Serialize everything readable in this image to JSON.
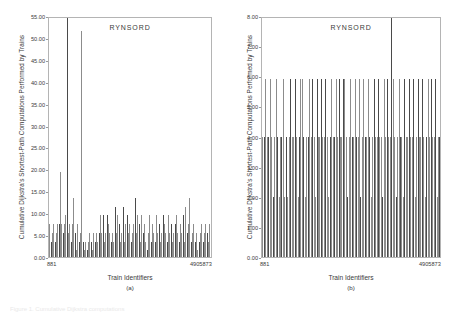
{
  "figure": {
    "background_color": "#ffffff",
    "bottom_caption": "Figure 1.  Cumulative Dijkstra computations"
  },
  "chart_data": [
    {
      "type": "bar",
      "panel_id": "a",
      "title": "RYNSORD",
      "xlabel": "Train Identifiers",
      "ylabel": "Cumulative Dijkstra's Shortest-Path Computations Performed by Trains",
      "subcaption": "(a)",
      "ylim": [
        0,
        55
      ],
      "yticks": [
        0,
        5,
        10,
        15,
        20,
        25,
        30,
        35,
        40,
        45,
        50,
        55
      ],
      "ytick_labels": [
        "0.00",
        "5.00",
        "10.00",
        "15.00",
        "20.00",
        "25.00",
        "30.00",
        "35.00",
        "40.00",
        "45.00",
        "50.00",
        "55.00"
      ],
      "xtick_labels": [
        "881",
        "4905873"
      ],
      "grid": false,
      "legend": "none",
      "bar_color": "#8c8c8c",
      "bar_color_dark": "#4a4a4a",
      "categories": [
        "881",
        "2",
        "3",
        "4",
        "5",
        "6",
        "7",
        "8",
        "9",
        "10",
        "11",
        "12",
        "13",
        "14",
        "15",
        "16",
        "17",
        "18",
        "19",
        "20",
        "21",
        "22",
        "23",
        "24",
        "25",
        "26",
        "27",
        "28",
        "29",
        "30",
        "31",
        "32",
        "33",
        "34",
        "35",
        "36",
        "37",
        "38",
        "39",
        "40",
        "41",
        "42",
        "43",
        "44",
        "45",
        "46",
        "47",
        "48",
        "49",
        "50",
        "51",
        "52",
        "53",
        "54",
        "55",
        "56",
        "57",
        "58",
        "59",
        "60",
        "61",
        "62",
        "63",
        "64",
        "65",
        "66",
        "67",
        "68",
        "69",
        "70",
        "71",
        "72",
        "73",
        "74",
        "75",
        "76",
        "77",
        "78",
        "79",
        "80",
        "81",
        "82",
        "83",
        "84",
        "85",
        "86",
        "87",
        "88",
        "89",
        "90",
        "91",
        "92",
        "93",
        "94",
        "95",
        "96",
        "97",
        "98",
        "99",
        "100",
        "101",
        "102",
        "103",
        "104",
        "105",
        "106",
        "107",
        "108",
        "109",
        "110",
        "111",
        "112",
        "113",
        "114",
        "115",
        "116",
        "117",
        "118",
        "119",
        "120",
        "121",
        "122",
        "4905873"
      ],
      "values": [
        7.5,
        3.4,
        5.4,
        7.5,
        3.4,
        5.4,
        7.5,
        7.5,
        19.3,
        7.5,
        5.4,
        7.5,
        9.5,
        55.0,
        5.4,
        7.5,
        3.4,
        7.5,
        13.4,
        5.4,
        1.6,
        7.5,
        3.4,
        5.4,
        51.5,
        3.4,
        1.6,
        3.4,
        1.6,
        3.4,
        5.4,
        3.4,
        1.6,
        5.4,
        3.4,
        5.4,
        3.4,
        5.4,
        9.5,
        5.4,
        9.5,
        3.4,
        5.4,
        9.5,
        7.5,
        5.4,
        3.4,
        5.4,
        3.4,
        11.4,
        5.4,
        9.5,
        7.5,
        3.4,
        5.4,
        11.4,
        3.4,
        7.5,
        9.5,
        5.4,
        7.5,
        3.4,
        5.4,
        7.5,
        13.4,
        5.4,
        9.5,
        7.5,
        3.4,
        9.5,
        5.4,
        7.5,
        3.4,
        1.6,
        5.4,
        9.5,
        3.4,
        7.5,
        5.4,
        3.4,
        9.5,
        5.4,
        7.5,
        3.4,
        5.4,
        9.5,
        7.5,
        5.4,
        3.4,
        9.5,
        5.4,
        7.5,
        3.4,
        5.4,
        7.5,
        9.5,
        5.4,
        3.4,
        7.5,
        5.4,
        9.5,
        3.4,
        11.4,
        5.4,
        7.5,
        13.4,
        3.4,
        5.4,
        7.5,
        3.4,
        5.4,
        1.6,
        3.4,
        5.4,
        7.5,
        3.4,
        5.4,
        7.5,
        5.4,
        3.4,
        7.5,
        5.4,
        9.5
      ]
    },
    {
      "type": "bar",
      "panel_id": "b",
      "title": "RYNSORD",
      "xlabel": "Train Identifiers",
      "ylabel": "Cumulative Dijkstra's Shortest-Path Computations Performed by Trains",
      "subcaption": "(b)",
      "ylim": [
        0,
        8
      ],
      "yticks": [
        0,
        1,
        2,
        3,
        4,
        5,
        6,
        7,
        8
      ],
      "ytick_labels": [
        "0.00",
        "1.00",
        "2.00",
        "3.00",
        "4.00",
        "5.00",
        "6.00",
        "7.00",
        "8.00"
      ],
      "xtick_labels": [
        "881",
        "4905873"
      ],
      "grid": false,
      "legend": "none",
      "bar_color": "#8c8c8c",
      "bar_color_dark": "#4a4a4a",
      "categories": [
        "881",
        "2",
        "3",
        "4",
        "5",
        "6",
        "7",
        "8",
        "9",
        "10",
        "11",
        "12",
        "13",
        "14",
        "15",
        "16",
        "17",
        "18",
        "19",
        "20",
        "21",
        "22",
        "23",
        "24",
        "25",
        "26",
        "27",
        "28",
        "29",
        "30",
        "31",
        "32",
        "33",
        "34",
        "35",
        "36",
        "37",
        "38",
        "39",
        "40",
        "41",
        "42",
        "43",
        "44",
        "45",
        "46",
        "47",
        "48",
        "49",
        "50",
        "51",
        "52",
        "53",
        "54",
        "55",
        "56",
        "57",
        "58",
        "59",
        "60",
        "61",
        "62",
        "63",
        "64",
        "65",
        "66",
        "67",
        "68",
        "69",
        "70",
        "71",
        "72",
        "73",
        "74",
        "75",
        "76",
        "77",
        "78",
        "79",
        "80",
        "81",
        "82",
        "83",
        "84",
        "85",
        "86",
        "87",
        "88",
        "89",
        "90",
        "91",
        "92",
        "93",
        "94",
        "95",
        "96",
        "97",
        "98",
        "99",
        "100",
        "101",
        "102",
        "103",
        "104",
        "105",
        "106",
        "107",
        "108",
        "109",
        "110",
        "111",
        "112",
        "113",
        "114",
        "115",
        "116",
        "117",
        "118",
        "119",
        "120",
        "121",
        "122",
        "4905873"
      ],
      "values": [
        4.0,
        4.0,
        5.9,
        4.0,
        4.0,
        5.9,
        4.0,
        2.0,
        4.0,
        5.9,
        4.0,
        2.0,
        4.0,
        4.0,
        5.9,
        2.0,
        4.0,
        2.0,
        4.0,
        5.9,
        4.0,
        4.0,
        5.9,
        4.0,
        2.0,
        4.0,
        5.9,
        5.9,
        4.0,
        2.0,
        4.0,
        4.0,
        5.9,
        4.0,
        5.9,
        4.0,
        2.0,
        5.9,
        4.0,
        4.0,
        5.9,
        4.0,
        4.0,
        5.9,
        4.0,
        2.0,
        4.0,
        5.9,
        4.0,
        4.0,
        5.9,
        4.0,
        5.9,
        4.0,
        4.0,
        5.9,
        5.9,
        4.0,
        2.0,
        4.0,
        5.9,
        4.0,
        4.0,
        5.9,
        4.0,
        4.0,
        5.9,
        2.0,
        4.0,
        5.9,
        4.0,
        4.0,
        5.9,
        4.0,
        2.0,
        4.0,
        5.9,
        4.0,
        4.0,
        5.9,
        4.0,
        4.0,
        2.0,
        5.9,
        4.0,
        5.9,
        4.0,
        4.0,
        8.0,
        5.9,
        4.0,
        2.0,
        4.0,
        5.9,
        4.0,
        4.0,
        2.0,
        5.9,
        4.0,
        4.0,
        5.9,
        4.0,
        4.0,
        5.9,
        2.0,
        4.0,
        5.9,
        4.0,
        4.0,
        5.9,
        4.0,
        2.0,
        4.0,
        5.9,
        4.0,
        5.9,
        4.0,
        4.0,
        5.9,
        2.0,
        4.0,
        4.0,
        5.9
      ]
    }
  ]
}
